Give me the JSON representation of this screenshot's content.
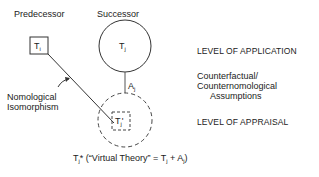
{
  "diagram": {
    "headers": {
      "predecessor": "Predecessor",
      "successor": "Successor"
    },
    "nodes": {
      "ti": {
        "base": "T",
        "sub": "i"
      },
      "tj": {
        "base": "T",
        "sub": "j"
      },
      "tj_prime": {
        "base": "T",
        "sub": "j",
        "suffix": "'"
      },
      "aj": {
        "base": "A",
        "sub": "j"
      }
    },
    "annotation": {
      "line1": "Nomological",
      "line2": "Isomorphism"
    },
    "caption": {
      "prefix": "T",
      "prefix_sub": "j",
      "rest1": "* (“Virtual Theory” = T",
      "rest_sub": "j",
      "rest2": " + A",
      "rest_sub2": "j",
      "rest3": ")"
    },
    "levels": {
      "application": "LEVEL OF APPLICATION",
      "assumptions_line1": "Counterfactual/",
      "assumptions_line2": "Counternomological",
      "assumptions_line3": "Assumptions",
      "appraisal": "LEVEL OF APPRAISAL"
    },
    "colors": {
      "stroke": "#333333",
      "text": "#222222",
      "background": "#ffffff"
    }
  }
}
